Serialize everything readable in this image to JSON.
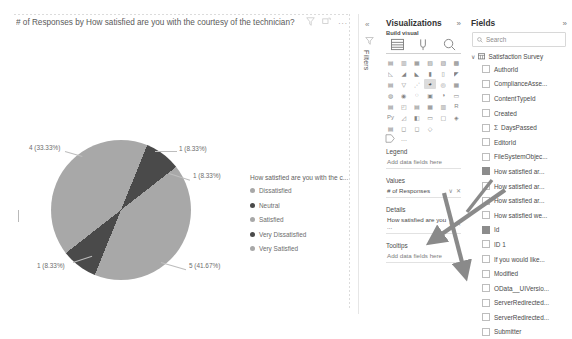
{
  "visual": {
    "title": "# of Responses by How satisfied are you with the courtesy of the technician?",
    "title_mark": "⌐",
    "header_icons": [
      "filter-icon",
      "focus-mode-icon",
      "more-options-icon"
    ],
    "more_options_label": "..."
  },
  "chart_data": {
    "type": "pie",
    "title": "# of Responses by How satisfied are you with the courtesy of the technician?",
    "legend_title": "How satisfied are you with the c...",
    "legend_position": "right",
    "categories": [
      "Dissatisfied",
      "Neutral",
      "Satisfied",
      "Very Dissatisfied",
      "Very Satisfied"
    ],
    "values": [
      1,
      1,
      5,
      1,
      4
    ],
    "percents": [
      "8.33%",
      "8.33%",
      "41.67%",
      "8.33%",
      "33.33%"
    ],
    "labels": [
      "1 (8.33%)",
      "1 (8.33%)",
      "5 (41.67%)",
      "1 (8.33%)",
      "4 (33.33%)"
    ],
    "colors": [
      "#a8a8a8",
      "#4a4a4a",
      "#a8a8a8",
      "#4a4a4a",
      "#a8a8a8"
    ],
    "total": 12
  },
  "filters_rail": {
    "label": "Filters",
    "collapse_chevron": "«",
    "funnel_icon": "filter-icon"
  },
  "visualizations": {
    "title": "Visualizations",
    "chevron": "»",
    "subtitle": "Build visual",
    "mode_icons": [
      "build-visual-icon",
      "format-visual-icon",
      "analytics-icon"
    ],
    "gallery_icons": [
      "stacked-bar-chart",
      "stacked-column-chart",
      "clustered-bar-chart",
      "clustered-column-chart",
      "hundred-percent-stacked-bar",
      "hundred-percent-stacked-column",
      "line-chart",
      "area-chart",
      "stacked-area-chart",
      "line-stacked-column",
      "line-clustered-column",
      "ribbon-chart",
      "waterfall-chart",
      "funnel-chart",
      "scatter-chart",
      "pie-chart",
      "donut-chart",
      "treemap",
      "map",
      "filled-map",
      "shape-map",
      "azure-map",
      "gauge",
      "card",
      "multi-row-card",
      "kpi",
      "slicer",
      "table",
      "matrix",
      "r-script-visual",
      "python-visual",
      "key-influencers",
      "decomposition-tree",
      "q-and-a",
      "smart-narrative",
      "metrics",
      "paginated-report",
      "power-apps",
      "power-automate",
      "get-more-visuals"
    ],
    "selected_gallery_icon": "pie-chart",
    "more_visuals_label": "...",
    "wells": [
      {
        "label": "Legend",
        "value": "Add data fields here",
        "filled": false
      },
      {
        "label": "Values",
        "value": "# of Responses",
        "filled": true
      },
      {
        "label": "Details",
        "value": "How satisfied are you ...",
        "filled": true
      },
      {
        "label": "Tooltips",
        "value": "Add data fields here",
        "filled": false
      }
    ],
    "well_control_chevron": "∨",
    "well_control_close": "✕"
  },
  "fields": {
    "title": "Fields",
    "chevron": "»",
    "search_placeholder": "Search",
    "search_icon": "search-icon",
    "table_name": "Satisfaction Survey",
    "table_chevron": "∨",
    "items": [
      {
        "name": "AuthorId",
        "checked": false,
        "aggregate": false
      },
      {
        "name": "ComplianceAsse...",
        "checked": false,
        "aggregate": false
      },
      {
        "name": "ContentTypeId",
        "checked": false,
        "aggregate": false
      },
      {
        "name": "Created",
        "checked": false,
        "aggregate": false
      },
      {
        "name": "DaysPassed",
        "checked": false,
        "aggregate": true
      },
      {
        "name": "EditorId",
        "checked": false,
        "aggregate": false
      },
      {
        "name": "FileSystemObjec...",
        "checked": false,
        "aggregate": false
      },
      {
        "name": "How satisfied ar...",
        "checked": true,
        "aggregate": false
      },
      {
        "name": "How satisfied ar...",
        "checked": false,
        "aggregate": false
      },
      {
        "name": "How satisfied ar...",
        "checked": false,
        "aggregate": false
      },
      {
        "name": "How satisfied we...",
        "checked": false,
        "aggregate": false
      },
      {
        "name": "Id",
        "checked": true,
        "aggregate": false
      },
      {
        "name": "ID 1",
        "checked": false,
        "aggregate": false
      },
      {
        "name": "If you would like...",
        "checked": false,
        "aggregate": false
      },
      {
        "name": "Modified",
        "checked": false,
        "aggregate": false
      },
      {
        "name": "OData__UIVersio...",
        "checked": false,
        "aggregate": false
      },
      {
        "name": "ServerRedirected...",
        "checked": false,
        "aggregate": false
      },
      {
        "name": "ServerRedirected...",
        "checked": false,
        "aggregate": false
      },
      {
        "name": "Submitter",
        "checked": false,
        "aggregate": false
      }
    ],
    "sigma_glyph": "Σ"
  },
  "annotations": {
    "arrow_color": "#8a8a8a",
    "arrows": [
      "arrow-to-values-well",
      "arrow-to-details-well"
    ]
  }
}
